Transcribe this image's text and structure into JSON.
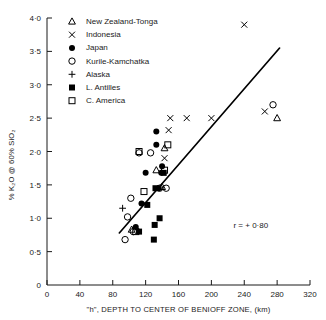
{
  "chart_data": {
    "type": "scatter",
    "title": "",
    "xlabel": "\"h\", DEPTH TO CENTER OF BENIOFF ZONE, (km)",
    "ylabel": "% K₂O @ 60% SiO₂",
    "ylabel_parts": {
      "pct1": "%",
      "k2o": "K₂O",
      "at": "@",
      "pct2": "60%",
      "sio2": "SiO₂"
    },
    "xlim": [
      0,
      320
    ],
    "ylim": [
      0,
      4.0
    ],
    "xticks": [
      0,
      40,
      80,
      120,
      160,
      200,
      240,
      280,
      320
    ],
    "xticklabels": [
      "0",
      "40",
      "80",
      "120",
      "160",
      "200",
      "240",
      "280",
      "320"
    ],
    "yticks": [
      0,
      0.5,
      1.0,
      1.5,
      2.0,
      2.5,
      3.0,
      3.5,
      4.0
    ],
    "yticklabels": [
      "0",
      "0·5",
      "1·0",
      "1·5",
      "2·0",
      "2·5",
      "3·0",
      "3·5",
      "4·0"
    ],
    "grid": false,
    "legend_position": "upper-left",
    "annotations": [
      {
        "name": "correlation-coefficient",
        "text": "r = + 0·80",
        "x": 248,
        "y": 0.85
      }
    ],
    "fit_line": {
      "name": "regression-line",
      "x": [
        88,
        283
      ],
      "y": [
        0.78,
        3.55
      ]
    },
    "series": [
      {
        "name": "New Zealand-Tonga",
        "marker": "open-triangle",
        "points": [
          [
            143,
            2.05
          ],
          [
            140,
            1.47
          ],
          [
            280,
            2.5
          ],
          [
            133,
            1.72
          ],
          [
            103,
            0.83
          ]
        ]
      },
      {
        "name": "Indonesia",
        "marker": "cross-x",
        "points": [
          [
            240,
            3.9
          ],
          [
            150,
            2.5
          ],
          [
            170,
            2.5
          ],
          [
            200,
            2.5
          ],
          [
            265,
            2.6
          ],
          [
            143,
            1.9
          ],
          [
            148,
            2.32
          ]
        ]
      },
      {
        "name": "Japan",
        "marker": "filled-circle",
        "points": [
          [
            133,
            2.3
          ],
          [
            133,
            2.1
          ],
          [
            140,
            1.78
          ],
          [
            139,
            1.68
          ],
          [
            115,
            1.22
          ],
          [
            120,
            1.68
          ],
          [
            108,
            0.87
          ],
          [
            136,
            1.45
          ]
        ]
      },
      {
        "name": "Kurile-Kamchatka",
        "marker": "open-circle",
        "points": [
          [
            112,
            1.98
          ],
          [
            102,
            1.3
          ],
          [
            98,
            1.02
          ],
          [
            95,
            0.68
          ],
          [
            105,
            0.8
          ],
          [
            275,
            2.7
          ],
          [
            145,
            1.45
          ],
          [
            137,
            1.45
          ],
          [
            126,
            1.98
          ]
        ]
      },
      {
        "name": "Alaska",
        "marker": "plus",
        "points": [
          [
            92,
            1.15
          ]
        ]
      },
      {
        "name": "L. Antilles",
        "marker": "filled-square",
        "points": [
          [
            122,
            1.2
          ],
          [
            132,
            1.45
          ],
          [
            131,
            0.9
          ],
          [
            137,
            1.0
          ],
          [
            130,
            0.68
          ],
          [
            142,
            1.68
          ],
          [
            112,
            0.8
          ]
        ]
      },
      {
        "name": "C. America",
        "marker": "open-square",
        "points": [
          [
            112,
            2.0
          ],
          [
            118,
            1.4
          ],
          [
            147,
            2.1
          ],
          [
            143,
            1.72
          ],
          [
            108,
            0.8
          ]
        ]
      }
    ]
  },
  "legend": {
    "items": [
      {
        "label": "New Zealand-Tonga",
        "marker": "open-triangle"
      },
      {
        "label": "Indonesia",
        "marker": "cross-x"
      },
      {
        "label": "Japan",
        "marker": "filled-circle"
      },
      {
        "label": "Kurile-Kamchatka",
        "marker": "open-circle"
      },
      {
        "label": "Alaska",
        "marker": "plus"
      },
      {
        "label": "L. Antilles",
        "marker": "filled-square"
      },
      {
        "label": "C. America",
        "marker": "open-square"
      }
    ]
  },
  "colors": {
    "ink": "#1a1a1a",
    "line": "#000000",
    "background": "#ffffff"
  }
}
